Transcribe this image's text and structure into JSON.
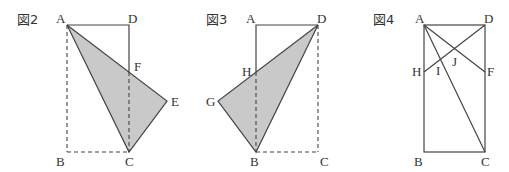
{
  "figures": [
    {
      "title": "図2",
      "labels": {
        "A": "A",
        "D": "D",
        "F": "F",
        "E": "E",
        "B": "B",
        "C": "C"
      }
    },
    {
      "title": "図3",
      "labels": {
        "A": "A",
        "D": "D",
        "H": "H",
        "G": "G",
        "B": "B",
        "C": "C"
      }
    },
    {
      "title": "図4",
      "labels": {
        "A": "A",
        "D": "D",
        "H": "H",
        "F": "F",
        "I": "I",
        "J": "J",
        "B": "B",
        "C": "C"
      }
    }
  ],
  "colors": {
    "line": "#444444",
    "shade": "#c9c9c9",
    "background": "#ffffff"
  }
}
